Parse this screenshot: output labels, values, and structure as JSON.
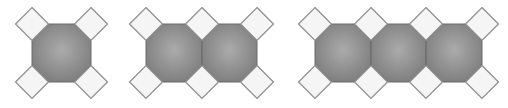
{
  "diagram": {
    "canvas": {
      "width": 508,
      "height": 108
    },
    "colors": {
      "background": "#ffffff",
      "octagon_center": "#ababab",
      "octagon_edge": "#7c7c7c",
      "octagon_stroke": "#6a6a6a",
      "square_fill": "#f5f5f5",
      "square_stroke": "#8c8c8c"
    },
    "geometry": {
      "top": 24,
      "bottom": 82,
      "chamfer": 17,
      "square_half_diagonal": 16.5
    },
    "groups": [
      {
        "name": "group-1-octagon",
        "octagon_count": 1,
        "x_edges": [
          32,
          91
        ]
      },
      {
        "name": "group-2-octagons",
        "octagon_count": 2,
        "x_edges": [
          146,
          202,
          257
        ]
      },
      {
        "name": "group-3-octagons",
        "octagon_count": 3,
        "x_edges": [
          315,
          371,
          426,
          482
        ]
      }
    ]
  }
}
